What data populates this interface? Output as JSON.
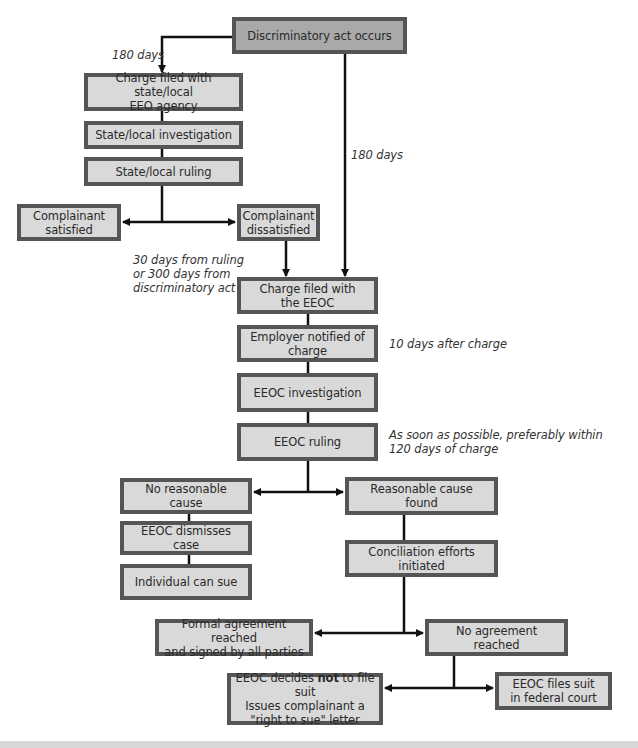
{
  "diagram": {
    "type": "flowchart",
    "topic": "EEOC discrimination charge process",
    "colors": {
      "box_fill": "#d9d9d9",
      "start_box_fill": "#a9a9a9",
      "box_border": "#555555",
      "connector": "#111111"
    },
    "nodes": {
      "discriminatory_act": "Discriminatory act occurs",
      "charge_state_local": [
        "Charge filed with state/local",
        "EEO agency"
      ],
      "state_local_investigation": "State/local investigation",
      "state_local_ruling": "State/local ruling",
      "complainant_satisfied": [
        "Complainant",
        "satisfied"
      ],
      "complainant_dissatisfied": [
        "Complainant",
        "dissatisfied"
      ],
      "charge_filed_eeoc": [
        "Charge filed with",
        "the EEOC"
      ],
      "employer_notified": [
        "Employer notified of",
        "charge"
      ],
      "eeoc_investigation": "EEOC investigation",
      "eeoc_ruling": "EEOC ruling",
      "no_reasonable_cause": "No reasonable cause",
      "eeoc_dismisses": "EEOC dismisses case",
      "individual_can_sue": "Individual can sue",
      "reasonable_cause_found": "Reasonable cause found",
      "conciliation": "Conciliation efforts initiated",
      "formal_agreement": [
        "Formal agreement reached",
        "and signed by all parties"
      ],
      "no_agreement": "No agreement reached",
      "eeoc_decides_not": {
        "prefix": "EEOC decides ",
        "bold": "not",
        "suffix": " to file suit",
        "line2": "Issues complainant a",
        "line3": "\"right to sue\" letter"
      },
      "eeoc_files_suit": [
        "EEOC files suit",
        "in federal court"
      ]
    },
    "annotations": {
      "days_180_left": "180 days",
      "days_180_right": "180 days",
      "thirty_days": [
        "30 days from ruling",
        "or 300 days from",
        "discriminatory act"
      ],
      "ten_days": "10 days after charge",
      "asap": [
        "As soon as possible, preferably within",
        "120 days of charge"
      ]
    }
  }
}
